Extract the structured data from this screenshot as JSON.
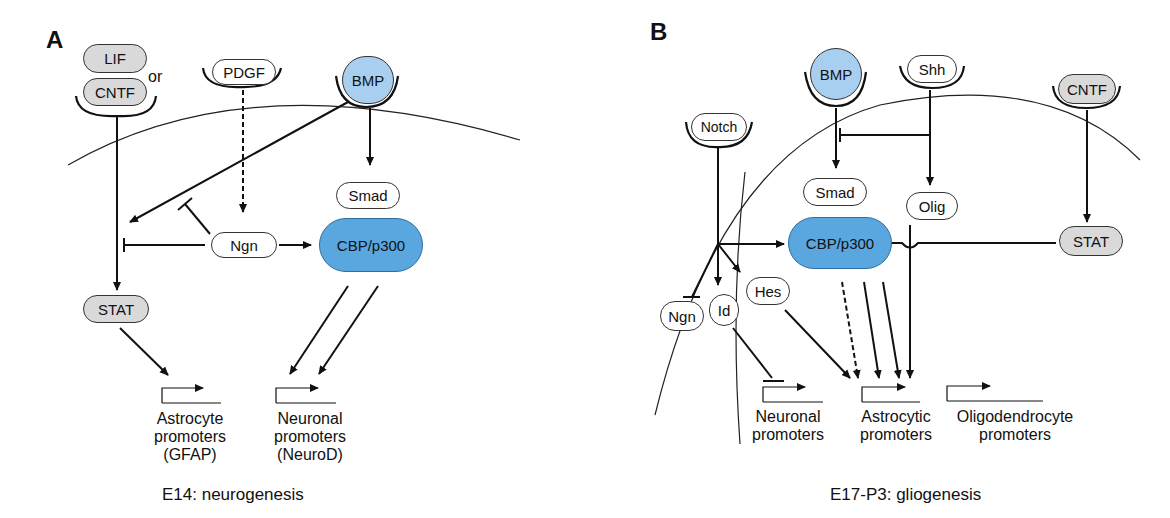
{
  "panels": [
    {
      "id": "A",
      "label": "A",
      "caption": "E14: neurogenesis",
      "ligands": {
        "lif": "LIF",
        "or": "or",
        "cntf": "CNTF",
        "pdgf": "PDGF",
        "bmp": "BMP"
      },
      "nodes": {
        "smad": "Smad",
        "cbp": "CBP/p300",
        "ngn": "Ngn",
        "stat": "STAT"
      },
      "promoters": [
        {
          "line1": "Astrocyte",
          "line2": "promoters",
          "line3": "(GFAP)"
        },
        {
          "line1": "Neuronal",
          "line2": "promoters",
          "line3": "(NeuroD)"
        }
      ]
    },
    {
      "id": "B",
      "label": "B",
      "caption": "E17-P3: gliogenesis",
      "ligands": {
        "notch": "Notch",
        "bmp": "BMP",
        "shh": "Shh",
        "cntf": "CNTF"
      },
      "nodes": {
        "smad": "Smad",
        "olig": "Olig",
        "cbp": "CBP/p300",
        "stat": "STAT",
        "ngn": "Ngn",
        "id": "Id",
        "hes": "Hes"
      },
      "promoters": [
        {
          "line1": "Neuronal",
          "line2": "promoters"
        },
        {
          "line1": "Astrocytic",
          "line2": "promoters"
        },
        {
          "line1": "Oligodendrocyte",
          "line2": "promoters"
        }
      ]
    }
  ],
  "colors": {
    "blue": "#5aa6df",
    "lightblue": "#a9cff0",
    "grey": "#d9d9d9"
  }
}
